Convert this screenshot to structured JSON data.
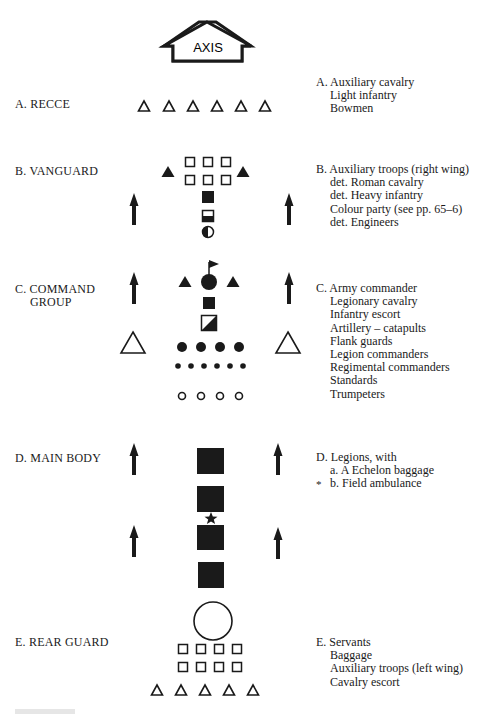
{
  "axis": {
    "label": "AXIS"
  },
  "sections": [
    {
      "id": "A",
      "label": "A. RECCE",
      "legend": [
        "A. Auxiliary cavalry",
        "Light infantry",
        "Bowmen"
      ]
    },
    {
      "id": "B",
      "label": "B. VANGUARD",
      "legend": [
        "B. Auxiliary troops (right wing)",
        "det. Roman cavalry",
        "det. Heavy infantry",
        "Colour party (see pp. 65–6)",
        "det. Engineers"
      ]
    },
    {
      "id": "C",
      "label_line1": "C. COMMAND",
      "label_line2": "GROUP",
      "legend": [
        "C. Army commander",
        "Legionary cavalry",
        "Infantry escort",
        "Artillery – catapults",
        "Flank guards",
        "Legion commanders",
        "Regimental commanders",
        "Standards",
        "Trumpeters"
      ]
    },
    {
      "id": "D",
      "label": "D. MAIN BODY",
      "legend": [
        "D. Legions, with",
        "a. A Echelon baggage",
        "b. Field ambulance"
      ],
      "marker": "*"
    },
    {
      "id": "E",
      "label": "E. REAR GUARD",
      "legend": [
        "E. Servants",
        "Baggage",
        "Auxiliary troops (left wing)",
        "Cavalry escort"
      ]
    }
  ],
  "symbols": {
    "open-triangle": "auxiliary/light troops",
    "filled-triangle": "cavalry",
    "open-square": "infantry",
    "filled-square": "heavy infantry / legion",
    "half-filled-square": "colour party",
    "half-filled-circle": "engineers",
    "arrow-up": "direction of march",
    "flag-circle": "army commander",
    "diagonal-square": "artillery",
    "filled-circle": "legion commanders",
    "small-dot": "regimental commanders",
    "small-open-circle": "trumpeters",
    "star": "field ambulance",
    "large-circle": "servants"
  },
  "colors": {
    "ink": "#1a1a1a",
    "paper": "#ffffff"
  }
}
